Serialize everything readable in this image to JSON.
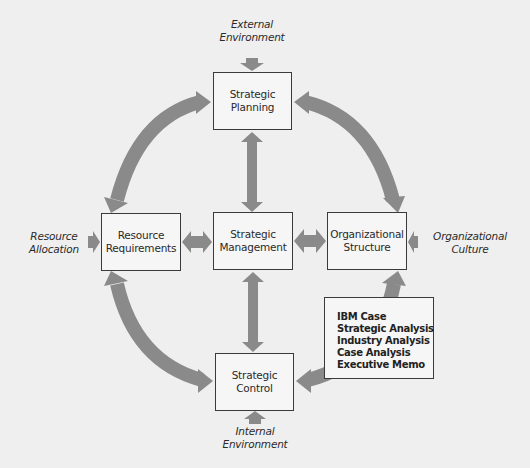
{
  "diagram": {
    "colors": {
      "background": "#efefef",
      "arrow": "#8a8a8a",
      "box_border": "#3a3a3a",
      "text": "#2a2a2a"
    },
    "nodes": {
      "planning": {
        "line1": "Strategic",
        "line2": "Planning"
      },
      "resource": {
        "line1": "Resource",
        "line2": "Requirements"
      },
      "management": {
        "line1": "Strategic",
        "line2": "Management"
      },
      "organizational": {
        "line1": "Organizational",
        "line2": "Structure"
      },
      "control": {
        "line1": "Strategic",
        "line2": "Control"
      }
    },
    "inputs": {
      "external": {
        "line1": "External",
        "line2": "Environment"
      },
      "allocation": {
        "line1": "Resource",
        "line2": "Allocation"
      },
      "culture": {
        "line1": "Organizational",
        "line2": "Culture"
      },
      "internal": {
        "line1": "Internal",
        "line2": "Environment"
      }
    },
    "case_box": {
      "items": [
        "IBM Case",
        "Strategic Analysis",
        "Industry Analysis",
        "Case Analysis",
        "Executive Memo"
      ]
    },
    "edges": [
      {
        "from": "planning",
        "to": "management",
        "type": "bidirectional"
      },
      {
        "from": "resource",
        "to": "management",
        "type": "bidirectional"
      },
      {
        "from": "management",
        "to": "organizational",
        "type": "bidirectional"
      },
      {
        "from": "management",
        "to": "control",
        "type": "bidirectional"
      },
      {
        "from": "planning",
        "to": "resource",
        "type": "bidirectional-arc"
      },
      {
        "from": "planning",
        "to": "organizational",
        "type": "bidirectional-arc"
      },
      {
        "from": "resource",
        "to": "control",
        "type": "bidirectional-arc"
      },
      {
        "from": "organizational",
        "to": "control",
        "type": "bidirectional-arc"
      },
      {
        "from": "external",
        "to": "planning",
        "type": "input"
      },
      {
        "from": "allocation",
        "to": "resource",
        "type": "input"
      },
      {
        "from": "culture",
        "to": "organizational",
        "type": "input"
      },
      {
        "from": "internal",
        "to": "control",
        "type": "input"
      }
    ]
  }
}
